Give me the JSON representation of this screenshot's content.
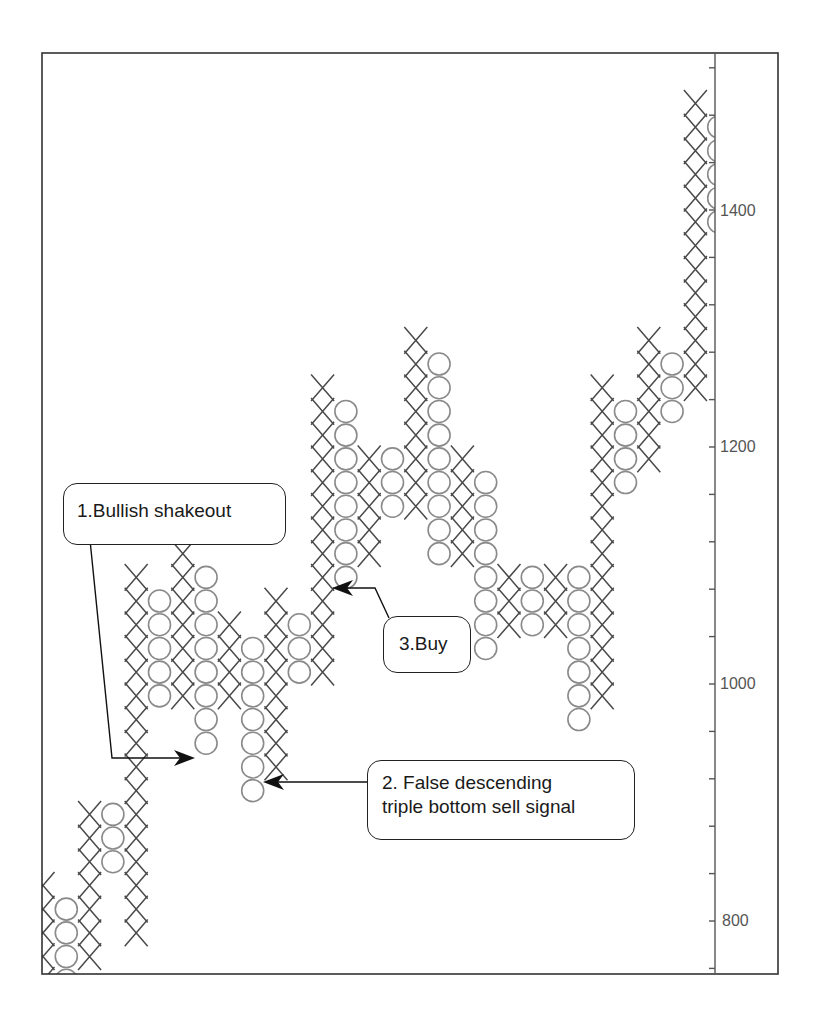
{
  "chart_data": {
    "type": "point-and-figure",
    "title": "",
    "xlabel": "",
    "ylabel": "",
    "box_size": 20,
    "ylim": [
      760,
      1520
    ],
    "y_ticks": [
      800,
      1000,
      1200,
      1400
    ],
    "y_minor_tick_step": 40,
    "grid": false,
    "colors": {
      "x_mark": "#4a4a4a",
      "o_mark": "#8a8a8a",
      "frame": "#333333",
      "text": "#1a1a1a"
    },
    "columns": [
      {
        "type": "X",
        "low": 740,
        "high": 820
      },
      {
        "type": "O",
        "low": 720,
        "high": 800
      },
      {
        "type": "X",
        "low": 760,
        "high": 880
      },
      {
        "type": "O",
        "low": 840,
        "high": 880
      },
      {
        "type": "X",
        "low": 780,
        "high": 1080
      },
      {
        "type": "O",
        "low": 980,
        "high": 1060
      },
      {
        "type": "X",
        "low": 980,
        "high": 1100
      },
      {
        "type": "O",
        "low": 940,
        "high": 1080
      },
      {
        "type": "X",
        "low": 980,
        "high": 1040
      },
      {
        "type": "O",
        "low": 900,
        "high": 1020
      },
      {
        "type": "X",
        "low": 920,
        "high": 1060
      },
      {
        "type": "O",
        "low": 1000,
        "high": 1040
      },
      {
        "type": "X",
        "low": 1000,
        "high": 1240
      },
      {
        "type": "O",
        "low": 1080,
        "high": 1220
      },
      {
        "type": "X",
        "low": 1100,
        "high": 1180
      },
      {
        "type": "O",
        "low": 1140,
        "high": 1180
      },
      {
        "type": "X",
        "low": 1140,
        "high": 1280
      },
      {
        "type": "O",
        "low": 1100,
        "high": 1260
      },
      {
        "type": "X",
        "low": 1100,
        "high": 1180
      },
      {
        "type": "O",
        "low": 1020,
        "high": 1160
      },
      {
        "type": "X",
        "low": 1040,
        "high": 1080
      },
      {
        "type": "O",
        "low": 1040,
        "high": 1080
      },
      {
        "type": "X",
        "low": 1040,
        "high": 1080
      },
      {
        "type": "O",
        "low": 960,
        "high": 1080
      },
      {
        "type": "X",
        "low": 980,
        "high": 1240
      },
      {
        "type": "O",
        "low": 1160,
        "high": 1220
      },
      {
        "type": "X",
        "low": 1180,
        "high": 1280
      },
      {
        "type": "O",
        "low": 1220,
        "high": 1260
      },
      {
        "type": "X",
        "low": 1240,
        "high": 1480
      },
      {
        "type": "O",
        "low": 1380,
        "high": 1460
      }
    ],
    "annotations": [
      {
        "id": 1,
        "text": "1.Bullish shakeout",
        "target_column": 7,
        "target_price": 940
      },
      {
        "id": 2,
        "text": "2. False descending triple bottom sell signal",
        "target_column": 9,
        "target_price": 920
      },
      {
        "id": 3,
        "text": "3.Buy",
        "target_column": 12,
        "target_price": 1080
      }
    ]
  },
  "axis": {
    "labels": [
      {
        "value": "1400",
        "price": 1400
      },
      {
        "value": "1200",
        "price": 1200
      },
      {
        "value": "1000",
        "price": 1000
      },
      {
        "value": "800",
        "price": 800
      }
    ]
  },
  "callouts": {
    "bullish_shakeout": "1.Bullish shakeout",
    "false_signal_line1": "2. False descending",
    "false_signal_line2": "triple bottom sell signal",
    "buy": "3.Buy"
  }
}
